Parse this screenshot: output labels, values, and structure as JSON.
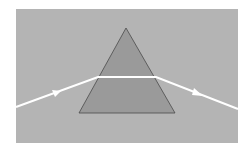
{
  "diagram": {
    "title": "",
    "colors": {
      "page_background": "#ffffff",
      "panel_background": "#b4b4b4",
      "prism_fill": "#9a9a9a",
      "prism_stroke": "#4a4a4a",
      "ray": "#ffffff"
    },
    "panel": {
      "x": 16,
      "y": 9,
      "width": 222,
      "height": 134
    },
    "prism": {
      "apex": [
        126,
        28
      ],
      "base_left": [
        79,
        113
      ],
      "base_right": [
        175,
        113
      ]
    },
    "ray": {
      "points": [
        [
          16,
          107
        ],
        [
          98,
          77
        ],
        [
          156,
          77
        ],
        [
          238,
          109
        ]
      ],
      "arrows": [
        {
          "position": [
            58,
            92
          ],
          "direction": "incoming"
        },
        {
          "position": [
            199,
            94
          ],
          "direction": "outgoing"
        }
      ]
    }
  }
}
